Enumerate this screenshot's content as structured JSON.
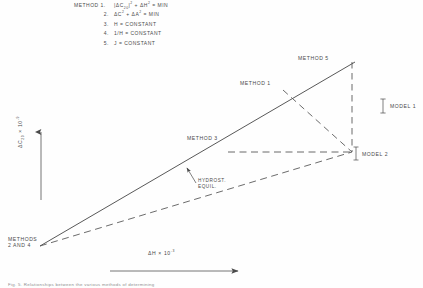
{
  "figure": {
    "caption": "Fig. 5.  Relationships between the various methods of determining"
  },
  "legend": {
    "rows": [
      {
        "num": "METHOD 1.",
        "eq_html": "|&Delta;C<sub>20</sub>|<sup>2</sup> + &Delta;H<sup>2</sup> = MIN",
        "indent": false
      },
      {
        "num": "2.",
        "eq_html": "&Delta;C<sup>2</sup> + &Delta;A<sup>2</sup> = MIN",
        "indent": true
      },
      {
        "num": "3.",
        "eq_html": "H = CONSTANT",
        "indent": true
      },
      {
        "num": "4.",
        "eq_html": "1/H = CONSTANT",
        "indent": true
      },
      {
        "num": "5.",
        "eq_html": "J = CONSTANT",
        "indent": true
      }
    ]
  },
  "axes": {
    "y_label_html": "&Delta;C<sub>20</sub> &times; 10<sup>-9</sup>",
    "x_label_html": "&Delta;H &times; 10<sup>-3</sup>"
  },
  "annotations": {
    "method_5": "METHOD 5",
    "method_1": "METHOD 1",
    "method_3": "METHOD 3",
    "methods_2_and_4": "METHODS\n2 AND 4",
    "methods_2_and_4_line1": "METHODS",
    "methods_2_and_4_line2": "2 AND 4",
    "hydrost_line1": "HYDROST.",
    "hydrost_line2": "EQUIL.",
    "model_1": "MODEL 1",
    "model_2": "MODEL 2"
  },
  "chart_data": {
    "type": "line",
    "title": "",
    "xlabel": "ΔH × 10^-3",
    "ylabel": "ΔC20 × 10^-9",
    "xlim": [
      0,
      1
    ],
    "ylim": [
      0,
      1
    ],
    "grid": false,
    "legend_position": "top-left",
    "annotations": [
      "METHOD 1.  |ΔC20|^2 + ΔH^2 = MIN",
      "2.  ΔC^2 + ΔA^2 = MIN",
      "3.  H = CONSTANT",
      "4.  1/H = CONSTANT",
      "5.  J = CONSTANT"
    ],
    "series": [
      {
        "name": "METHOD 5",
        "style": "solid",
        "points": [
          [
            0.045,
            0.055
          ],
          [
            0.86,
            0.8
          ]
        ],
        "label_at": [
          0.755,
          0.845
        ]
      },
      {
        "name": "METHODS 2 AND 4",
        "style": "dashed",
        "points": [
          [
            0.045,
            0.055
          ],
          [
            0.855,
            0.415
          ]
        ],
        "label_at": [
          0.02,
          0.13
        ]
      },
      {
        "name": "METHOD 3",
        "style": "dashed",
        "points": [
          [
            0.525,
            0.415
          ],
          [
            0.855,
            0.415
          ]
        ],
        "label_at": [
          0.445,
          0.455
        ]
      },
      {
        "name": "METHOD 1",
        "style": "dashed",
        "points": [
          [
            0.655,
            0.645
          ],
          [
            0.855,
            0.415
          ]
        ],
        "label_at": [
          0.575,
          0.695
        ]
      },
      {
        "name": "vertical-dashed-model-1",
        "style": "dashed",
        "points": [
          [
            0.855,
            0.8
          ],
          [
            0.855,
            0.415
          ]
        ],
        "label_at": null
      }
    ],
    "markers": [
      {
        "name": "MODEL 1",
        "x": 0.9,
        "y": 0.605
      },
      {
        "name": "MODEL 2",
        "x": 0.875,
        "y": 0.415
      },
      {
        "name": "HYDROST. EQUIL.",
        "x": 0.455,
        "y": 0.305
      }
    ]
  }
}
